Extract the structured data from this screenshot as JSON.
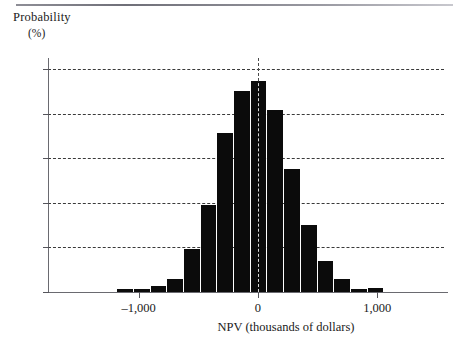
{
  "chart_data": {
    "type": "bar",
    "title": "",
    "subtitle": "",
    "xlabel": "NPV (thousands of dollars)",
    "ylabel": "Probability",
    "ylabel_unit": "(%)",
    "ylim": [
      0,
      21
    ],
    "xlim": [
      -1760,
      1560
    ],
    "grid": "horizontal-dashed",
    "legend": "none",
    "bin_width": 140,
    "categories": [
      -1110,
      -970,
      -830,
      -690,
      -550,
      -410,
      -270,
      -130,
      10,
      150,
      290,
      430,
      570,
      710,
      850,
      990
    ],
    "values": [
      0.3,
      0.3,
      0.5,
      1.2,
      3.9,
      7.8,
      14.3,
      18.0,
      18.9,
      16.3,
      11.0,
      6.0,
      2.8,
      1.2,
      0.3,
      0.4
    ],
    "bar_color": "#0b0b0b",
    "y_ticks": [
      0,
      4,
      8,
      12,
      16,
      20
    ],
    "y_tick_labels": [
      "0",
      "4",
      "8",
      "12",
      "16",
      "20"
    ],
    "x_ticks": [
      -1000,
      0,
      1000
    ],
    "x_tick_labels": [
      "–1,000",
      "0",
      "1,000"
    ],
    "annotations": [
      {
        "name": "zero-reference-line",
        "x": 0,
        "style": "dashed-vertical"
      }
    ]
  },
  "figure": {
    "top_rule": "horizontal-rule"
  }
}
